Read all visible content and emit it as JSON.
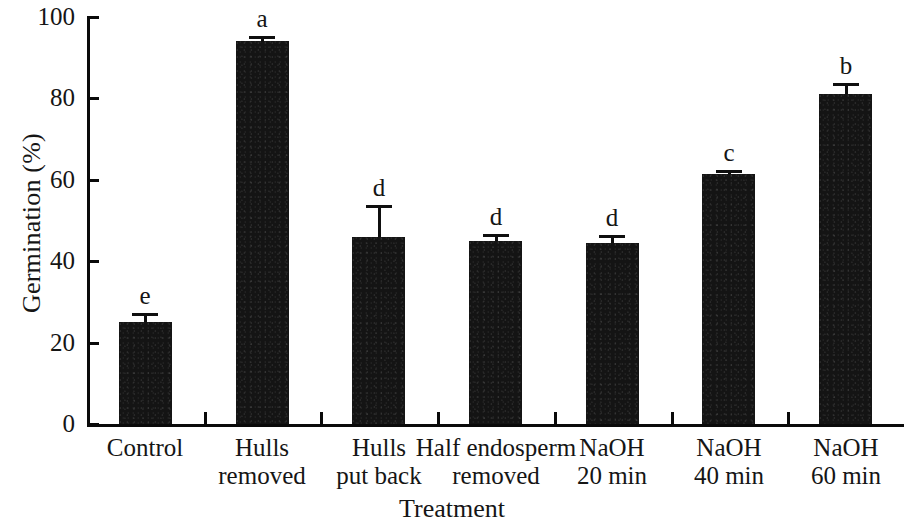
{
  "chart_data": {
    "type": "bar",
    "title": "",
    "xlabel": "Treatment",
    "ylabel": "Germination (%)",
    "categories": [
      "Control",
      "Hulls removed",
      "Hulls put back",
      "Half endosperm removed",
      "NaOH 20 min",
      "NaOH 40 min",
      "NaOH 60 min"
    ],
    "category_lines": [
      [
        "Control"
      ],
      [
        "Hulls",
        "removed"
      ],
      [
        "Hulls",
        "put back"
      ],
      [
        "Half endosperm",
        "removed"
      ],
      [
        "NaOH",
        "20 min"
      ],
      [
        "NaOH",
        "40 min"
      ],
      [
        "NaOH",
        "60 min"
      ]
    ],
    "values": [
      25,
      94,
      46,
      45,
      44.5,
      61.5,
      81
    ],
    "errors": [
      2.2,
      1.4,
      7.8,
      1.8,
      2.0,
      1.0,
      2.8
    ],
    "significance_letters": [
      "e",
      "a",
      "d",
      "d",
      "d",
      "c",
      "b"
    ],
    "ylim": [
      0,
      100
    ],
    "yticks": [
      0,
      20,
      40,
      60,
      80,
      100
    ],
    "ytick_labels": [
      "0",
      "20",
      "40",
      "60",
      "80",
      "100"
    ],
    "grid": false,
    "legend": "none",
    "bar_color": "#141414",
    "axis_color": "#0a0a0a"
  }
}
